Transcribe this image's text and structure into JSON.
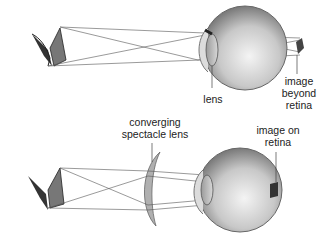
{
  "top_panel": {
    "title": "Farsightedness (uncorrected)",
    "labels": {
      "lens": "lens",
      "image_line1": "image",
      "image_line2": "beyond",
      "image_line3": "retina"
    }
  },
  "bottom_panel": {
    "title": "Farsightedness corrected",
    "labels": {
      "spectacle_line1": "converging",
      "spectacle_line2": "spectacle lens",
      "image_line1": "image on",
      "image_line2": "retina"
    }
  },
  "colors": {
    "line": "#444444",
    "eye_fill": "#bfbfbf",
    "spectacle_fill": "#b0b0b0",
    "text": "#222222"
  }
}
